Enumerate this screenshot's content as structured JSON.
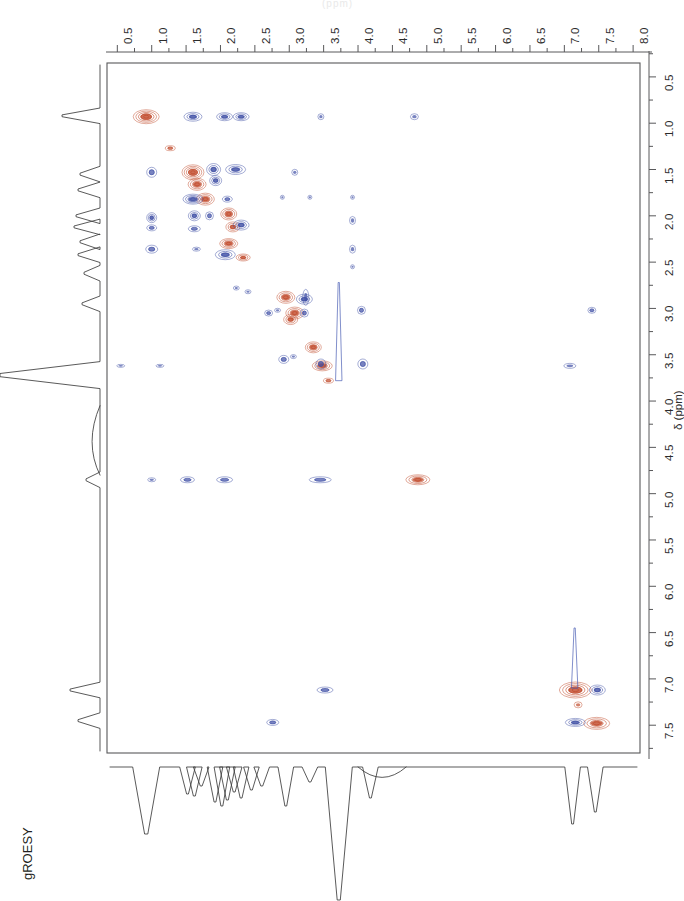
{
  "figure": {
    "experiment_label": "gROESY",
    "top_partial_text": "(ppm)",
    "axis_title_f1": "δ (ppm)",
    "positive_color": "#c14b2c",
    "negative_color": "#3f4fa5",
    "frame_color": "#58585a",
    "trace_color": "#3c3c3c"
  },
  "chart_data": {
    "type": "scatter",
    "title": "gROESY",
    "xlabel": "δ (ppm)",
    "ylabel": "δ (ppm)",
    "xlim": [
      0.35,
      8.1
    ],
    "ylim": [
      0.35,
      7.8
    ],
    "x_axis_position": "top",
    "y_axis_position": "right",
    "x_direction": "increasing-right",
    "y_direction": "increasing-down",
    "grid": false,
    "legend": "none",
    "x_ticks": [
      0.5,
      1.0,
      1.5,
      2.0,
      2.5,
      3.0,
      3.5,
      4.0,
      4.5,
      5.0,
      5.5,
      6.0,
      6.5,
      7.0,
      7.5,
      8.0
    ],
    "x_ticklabels": [
      "0.5",
      "1.0",
      "1.5",
      "2.0",
      "2.5",
      "3.0",
      "3.5",
      "4.0",
      "4.5",
      "5.0",
      "5.5",
      "6.0",
      "6.5",
      "7.0",
      "7.5",
      "8.0"
    ],
    "x_minor_tick_interval": 0.25,
    "y_ticks": [
      0.5,
      1.0,
      1.5,
      2.0,
      2.5,
      3.0,
      3.5,
      4.0,
      4.5,
      5.0,
      5.5,
      6.0,
      6.5,
      7.0,
      7.5
    ],
    "y_ticklabels": [
      "0.5",
      "1.0",
      "1.5",
      "2.0",
      "2.5",
      "3.0",
      "3.5",
      "4.0",
      "4.5",
      "5.0",
      "5.5",
      "6.0",
      "6.5",
      "7.0",
      "7.5"
    ],
    "y_minor_tick_interval": 0.25,
    "series": [
      {
        "name": "positive cross-peaks",
        "sign": "positive",
        "color": "#c14b2c",
        "points": [
          {
            "x": 0.92,
            "y": 0.93,
            "rx": 13,
            "ry": 7,
            "rings": 5
          },
          {
            "x": 1.27,
            "y": 1.27,
            "rx": 5,
            "ry": 2.5,
            "rings": 2
          },
          {
            "x": 1.6,
            "y": 1.53,
            "rx": 11,
            "ry": 7.5,
            "rings": 5
          },
          {
            "x": 1.66,
            "y": 1.66,
            "rx": 9,
            "ry": 6,
            "rings": 4
          },
          {
            "x": 1.78,
            "y": 1.82,
            "rx": 9,
            "ry": 6,
            "rings": 4
          },
          {
            "x": 2.12,
            "y": 1.98,
            "rx": 8,
            "ry": 6,
            "rings": 4
          },
          {
            "x": 2.18,
            "y": 2.12,
            "rx": 7,
            "ry": 5,
            "rings": 3
          },
          {
            "x": 2.12,
            "y": 2.3,
            "rx": 9,
            "ry": 5,
            "rings": 4
          },
          {
            "x": 2.33,
            "y": 2.45,
            "rx": 7,
            "ry": 3.5,
            "rings": 3
          },
          {
            "x": 2.95,
            "y": 2.88,
            "rx": 9,
            "ry": 6,
            "rings": 4
          },
          {
            "x": 3.08,
            "y": 3.05,
            "rx": 9,
            "ry": 6,
            "rings": 4
          },
          {
            "x": 3.02,
            "y": 3.12,
            "rx": 7,
            "ry": 5,
            "rings": 3
          },
          {
            "x": 3.35,
            "y": 3.42,
            "rx": 8,
            "ry": 5.5,
            "rings": 4
          },
          {
            "x": 3.48,
            "y": 3.62,
            "rx": 10,
            "ry": 5,
            "rings": 4
          },
          {
            "x": 3.57,
            "y": 3.78,
            "rx": 5,
            "ry": 2.5,
            "rings": 2
          },
          {
            "x": 4.87,
            "y": 4.85,
            "rx": 12,
            "ry": 5,
            "rings": 4
          },
          {
            "x": 7.16,
            "y": 7.12,
            "rx": 16,
            "ry": 8,
            "rings": 5
          },
          {
            "x": 7.2,
            "y": 7.28,
            "rx": 4,
            "ry": 3,
            "rings": 1
          },
          {
            "x": 7.47,
            "y": 7.48,
            "rx": 13,
            "ry": 6,
            "rings": 4
          }
        ]
      },
      {
        "name": "negative cross-peaks",
        "sign": "negative",
        "color": "#3f4fa5",
        "points": [
          {
            "x": 1.6,
            "y": 0.93,
            "rx": 9,
            "ry": 4.5,
            "rings": 3
          },
          {
            "x": 2.06,
            "y": 0.93,
            "rx": 8,
            "ry": 4,
            "rings": 3
          },
          {
            "x": 2.3,
            "y": 0.93,
            "rx": 8,
            "ry": 4,
            "rings": 3
          },
          {
            "x": 3.46,
            "y": 0.93,
            "rx": 3,
            "ry": 3,
            "rings": 1
          },
          {
            "x": 4.82,
            "y": 0.93,
            "rx": 4,
            "ry": 3,
            "rings": 1
          },
          {
            "x": 1.0,
            "y": 1.53,
            "rx": 5,
            "ry": 5,
            "rings": 2
          },
          {
            "x": 1.9,
            "y": 1.5,
            "rx": 7,
            "ry": 6,
            "rings": 3
          },
          {
            "x": 1.93,
            "y": 1.62,
            "rx": 6,
            "ry": 5,
            "rings": 3
          },
          {
            "x": 2.22,
            "y": 1.5,
            "rx": 10,
            "ry": 5,
            "rings": 3
          },
          {
            "x": 3.08,
            "y": 1.53,
            "rx": 3,
            "ry": 3,
            "rings": 1
          },
          {
            "x": 1.6,
            "y": 1.82,
            "rx": 10,
            "ry": 5,
            "rings": 4
          },
          {
            "x": 2.1,
            "y": 1.82,
            "rx": 5,
            "ry": 3,
            "rings": 2
          },
          {
            "x": 2.9,
            "y": 1.8,
            "rx": 2,
            "ry": 2,
            "rings": 1
          },
          {
            "x": 3.3,
            "y": 1.8,
            "rx": 2,
            "ry": 2,
            "rings": 1
          },
          {
            "x": 3.92,
            "y": 1.8,
            "rx": 2,
            "ry": 2,
            "rings": 1
          },
          {
            "x": 1.0,
            "y": 2.02,
            "rx": 5,
            "ry": 5,
            "rings": 3
          },
          {
            "x": 1.0,
            "y": 2.13,
            "rx": 5,
            "ry": 3,
            "rings": 2
          },
          {
            "x": 1.62,
            "y": 2.0,
            "rx": 6,
            "ry": 5,
            "rings": 3
          },
          {
            "x": 1.62,
            "y": 2.14,
            "rx": 6,
            "ry": 3,
            "rings": 2
          },
          {
            "x": 1.84,
            "y": 2.0,
            "rx": 4,
            "ry": 4,
            "rings": 2
          },
          {
            "x": 2.3,
            "y": 2.1,
            "rx": 8,
            "ry": 5,
            "rings": 3
          },
          {
            "x": 3.92,
            "y": 2.05,
            "rx": 3,
            "ry": 4,
            "rings": 1
          },
          {
            "x": 1.0,
            "y": 2.36,
            "rx": 6,
            "ry": 4,
            "rings": 2
          },
          {
            "x": 1.65,
            "y": 2.36,
            "rx": 4,
            "ry": 2,
            "rings": 1
          },
          {
            "x": 2.07,
            "y": 2.42,
            "rx": 10,
            "ry": 5,
            "rings": 3
          },
          {
            "x": 3.92,
            "y": 2.36,
            "rx": 3,
            "ry": 4,
            "rings": 1
          },
          {
            "x": 3.92,
            "y": 2.55,
            "rx": 2,
            "ry": 2,
            "rings": 1
          },
          {
            "x": 2.23,
            "y": 2.78,
            "rx": 3,
            "ry": 2,
            "rings": 1
          },
          {
            "x": 2.4,
            "y": 2.82,
            "rx": 3,
            "ry": 2,
            "rings": 1
          },
          {
            "x": 3.22,
            "y": 2.9,
            "rx": 8,
            "ry": 5,
            "rings": 3
          },
          {
            "x": 3.24,
            "y": 2.88,
            "rx": 3,
            "ry": 8,
            "rings": 1
          },
          {
            "x": 2.7,
            "y": 3.05,
            "rx": 4,
            "ry": 3,
            "rings": 2
          },
          {
            "x": 2.83,
            "y": 3.02,
            "rx": 3,
            "ry": 2,
            "rings": 1
          },
          {
            "x": 3.22,
            "y": 3.05,
            "rx": 4,
            "ry": 4,
            "rings": 2
          },
          {
            "x": 4.05,
            "y": 3.02,
            "rx": 4,
            "ry": 4,
            "rings": 2
          },
          {
            "x": 0.55,
            "y": 3.62,
            "rx": 4,
            "ry": 1.5,
            "rings": 1
          },
          {
            "x": 1.12,
            "y": 3.62,
            "rx": 4,
            "ry": 1.5,
            "rings": 1
          },
          {
            "x": 2.92,
            "y": 3.55,
            "rx": 5,
            "ry": 4,
            "rings": 2
          },
          {
            "x": 3.06,
            "y": 3.52,
            "rx": 3,
            "ry": 2,
            "rings": 1
          },
          {
            "x": 3.46,
            "y": 3.6,
            "rx": 5,
            "ry": 5,
            "rings": 2
          },
          {
            "x": 4.07,
            "y": 3.6,
            "rx": 5,
            "ry": 5,
            "rings": 2
          },
          {
            "x": 7.4,
            "y": 3.02,
            "rx": 4,
            "ry": 3,
            "rings": 2
          },
          {
            "x": 7.08,
            "y": 3.62,
            "rx": 6,
            "ry": 2.5,
            "rings": 1
          },
          {
            "x": 1.0,
            "y": 4.85,
            "rx": 4,
            "ry": 2,
            "rings": 1
          },
          {
            "x": 1.52,
            "y": 4.85,
            "rx": 7,
            "ry": 3,
            "rings": 2
          },
          {
            "x": 2.06,
            "y": 4.85,
            "rx": 8,
            "ry": 3,
            "rings": 2
          },
          {
            "x": 3.45,
            "y": 4.85,
            "rx": 11,
            "ry": 3,
            "rings": 2
          },
          {
            "x": 3.52,
            "y": 7.12,
            "rx": 8,
            "ry": 3,
            "rings": 2
          },
          {
            "x": 7.48,
            "y": 7.12,
            "rx": 8,
            "ry": 5,
            "rings": 3
          },
          {
            "x": 2.76,
            "y": 7.47,
            "rx": 6,
            "ry": 3,
            "rings": 2
          },
          {
            "x": 7.16,
            "y": 7.47,
            "rx": 10,
            "ry": 4,
            "rings": 3
          }
        ]
      }
    ],
    "annotations": [
      {
        "type": "t1-noise-streak",
        "x": 3.72,
        "y_from": 2.72,
        "y_to": 3.78
      },
      {
        "type": "t1-noise-streak",
        "x": 7.15,
        "y_from": 6.45,
        "y_to": 7.1
      }
    ],
    "f2_projection": {
      "description": "1D proton projection along bottom, peaks point downward",
      "peaks_ppm": [
        0.92,
        1.52,
        1.62,
        1.72,
        1.92,
        2.02,
        2.1,
        2.2,
        2.3,
        2.45,
        2.6,
        2.95,
        3.3,
        3.72,
        4.18,
        7.12,
        7.45
      ]
    },
    "f1_projection": {
      "description": "1D proton projection along left edge, peaks point left",
      "peaks_ppm": [
        0.92,
        1.55,
        1.72,
        2.0,
        2.12,
        2.28,
        2.42,
        2.62,
        2.95,
        3.72,
        4.85,
        7.12,
        7.45
      ]
    }
  }
}
